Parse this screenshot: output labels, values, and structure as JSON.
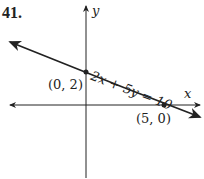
{
  "problem_number": "41.",
  "axes": {
    "x_label": "x",
    "y_label": "y"
  },
  "line": {
    "equation": "2x + 5y = 10",
    "color": "#222222"
  },
  "points": [
    {
      "label": "(0, 2)",
      "x": 0,
      "y": 2
    },
    {
      "label": "(5, 0)",
      "x": 5,
      "y": 0
    }
  ]
}
